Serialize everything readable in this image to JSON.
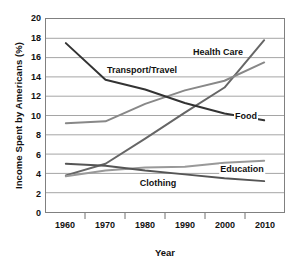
{
  "chart_data": {
    "type": "line",
    "title": "",
    "xlabel": "Year",
    "ylabel": "Income Spent by Americans (%)",
    "x": [
      1960,
      1970,
      1980,
      1990,
      2000,
      2010
    ],
    "xlim": [
      1955,
      2015
    ],
    "ylim": [
      0,
      20
    ],
    "ytick_values": [
      0,
      2,
      4,
      6,
      8,
      10,
      12,
      14,
      16,
      18,
      20
    ],
    "ytick_labels": [
      "0",
      "2",
      "4",
      "6",
      "8",
      "10",
      "12",
      "14",
      "16",
      "18",
      "20"
    ],
    "xtick_labels": [
      "1960",
      "1970",
      "1980",
      "1990",
      "2000",
      "2010"
    ],
    "grid": "horizontal",
    "legend": "inline-labels",
    "series": [
      {
        "name": "Health Care",
        "color": "#666666",
        "values": [
          3.8,
          5.0,
          7.6,
          10.3,
          12.9,
          17.8
        ],
        "label_x": 1998,
        "label_y": 16.6
      },
      {
        "name": "Transport/Travel",
        "color": "#888888",
        "values": [
          9.2,
          9.4,
          11.2,
          12.6,
          13.6,
          15.5
        ],
        "label_x": 1979,
        "label_y": 14.8
      },
      {
        "name": "Food",
        "color": "#333333",
        "values": [
          17.5,
          13.7,
          12.7,
          11.3,
          10.2,
          9.5
        ],
        "label_x": 2005,
        "label_y": 10.1
      },
      {
        "name": "Education",
        "color": "#999999",
        "values": [
          3.7,
          4.3,
          4.6,
          4.7,
          5.1,
          5.3
        ],
        "label_x": 2004,
        "label_y": 4.6
      },
      {
        "name": "Clothing",
        "color": "#555555",
        "values": [
          5.0,
          4.8,
          4.3,
          3.9,
          3.5,
          3.2
        ],
        "label_x": 1983,
        "label_y": 3.2
      }
    ]
  }
}
